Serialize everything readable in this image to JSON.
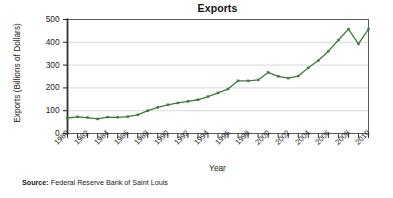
{
  "chart_data": {
    "type": "line",
    "title": "Exports",
    "xlabel": "Year",
    "ylabel": "Exports (Billions of Dollars)",
    "xlim": [
      1980,
      2010
    ],
    "ylim": [
      0,
      500
    ],
    "yticks": [
      0,
      100,
      200,
      300,
      400,
      500
    ],
    "ytick_labels": [
      "0",
      "100",
      "200",
      "300",
      "400",
      "500"
    ],
    "xticks": [
      1980,
      1981,
      1982,
      1983,
      1984,
      1985,
      1986,
      1987,
      1988,
      1989,
      1990,
      1991,
      1992,
      1993,
      1994,
      1995,
      1996,
      1997,
      1998,
      1999,
      2000,
      2001,
      2002,
      2003,
      2004,
      2005,
      2006,
      2007,
      2008,
      2009,
      2010
    ],
    "xtick_labels": [
      "1980",
      "1982",
      "1984",
      "1986",
      "1988",
      "1990",
      "1992",
      "1994",
      "1996",
      "1998",
      "2000",
      "2002",
      "2004",
      "2006",
      "2008",
      "2010"
    ],
    "xtick_label_years": [
      1980,
      1982,
      1984,
      1986,
      1988,
      1990,
      1992,
      1994,
      1996,
      1998,
      2000,
      2002,
      2004,
      2006,
      2008,
      2010
    ],
    "grid": "horizontal",
    "legend": "none",
    "line_color": "#3f7a3f",
    "marker": "square",
    "x": [
      1980,
      1981,
      1982,
      1983,
      1984,
      1985,
      1986,
      1987,
      1988,
      1989,
      1990,
      1991,
      1992,
      1993,
      1994,
      1995,
      1996,
      1997,
      1998,
      1999,
      2000,
      2001,
      2002,
      2003,
      2004,
      2005,
      2006,
      2007,
      2008,
      2009,
      2010
    ],
    "values": [
      68,
      73,
      70,
      64,
      72,
      71,
      74,
      82,
      100,
      115,
      126,
      134,
      141,
      148,
      162,
      178,
      195,
      231,
      231,
      235,
      268,
      251,
      243,
      252,
      288,
      320,
      361,
      410,
      458,
      393,
      458
    ],
    "series": [
      {
        "name": "Exports",
        "values": [
          68,
          73,
          70,
          64,
          72,
          71,
          74,
          82,
          100,
          115,
          126,
          134,
          141,
          148,
          162,
          178,
          195,
          231,
          231,
          235,
          268,
          251,
          243,
          252,
          288,
          320,
          361,
          410,
          458,
          393,
          458
        ]
      }
    ]
  },
  "source": {
    "label": "Source:",
    "text": " Federal Reserve Bank of Saint Louis"
  }
}
